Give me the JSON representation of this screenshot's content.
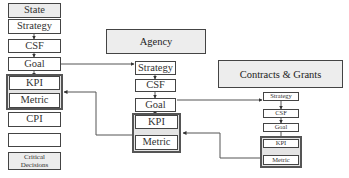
{
  "state_column": {
    "items": [
      {
        "label": "State"
      },
      {
        "label": "Strategy"
      },
      {
        "label": "CSF"
      },
      {
        "label": "Goal"
      },
      {
        "label": "KPI"
      },
      {
        "label": "Metric"
      },
      {
        "label": "CPI"
      },
      {
        "label": ""
      },
      {
        "label": "Critical Decisions",
        "lines": [
          "Critical",
          "Decisions"
        ]
      }
    ]
  },
  "agency": {
    "header": "Agency",
    "items": [
      {
        "label": "Strategy"
      },
      {
        "label": "CSF"
      },
      {
        "label": "Goal"
      },
      {
        "label": "KPI"
      },
      {
        "label": "Metric"
      }
    ]
  },
  "contracts_grants": {
    "header": "Contracts & Grants",
    "items": [
      {
        "label": "Strategy"
      },
      {
        "label": "CSF"
      },
      {
        "label": "Goal"
      },
      {
        "label": "KPI"
      },
      {
        "label": "Metric"
      }
    ]
  },
  "connections": [
    {
      "from": "state.Goal",
      "to": "agency.Strategy"
    },
    {
      "from": "agency.Goal",
      "to": "contracts_grants.Strategy"
    },
    {
      "from": "agency.KPI-Metric",
      "to": "state.KPI-Metric"
    },
    {
      "from": "contracts_grants.KPI-Metric",
      "to": "agency.KPI-Metric"
    }
  ],
  "colors": {
    "line": "#444444",
    "header_fill": "#ededed",
    "group_fill": "#e4e4e4"
  }
}
